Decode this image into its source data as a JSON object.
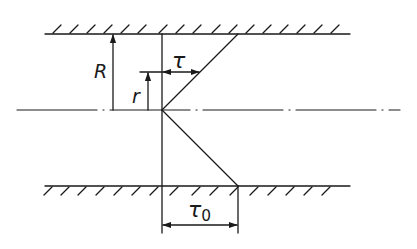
{
  "diagram": {
    "title": "",
    "colors": {
      "ink": "#1a1a1a",
      "background": "#ffffff"
    },
    "labels": {
      "R": "R",
      "r": "r",
      "tau": "τ",
      "tau0_main": "τ",
      "tau0_sub": "0"
    },
    "elements": [
      "top-wall-with-hatching",
      "bottom-wall-with-hatching",
      "centerline-dash-dot",
      "reference-vertical-line",
      "stress-profile-upper",
      "stress-profile-lower",
      "dimension-R",
      "dimension-r",
      "dimension-tau",
      "dimension-tau0"
    ]
  }
}
